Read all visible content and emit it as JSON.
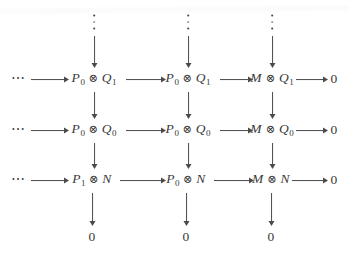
{
  "diagram": {
    "kind": "commutative-diagram",
    "ink_color": "#4a4a4a",
    "background_color": "#ffffff",
    "symbols": {
      "tensor": "⊗",
      "ellipsis_horizontal": "⋯",
      "vdots": "⋮",
      "zero": "0"
    },
    "columns": [
      {
        "id": "col-1",
        "x": 94
      },
      {
        "id": "col-2",
        "x": 188
      },
      {
        "id": "col-3",
        "x": 272
      },
      {
        "id": "col-zero",
        "x": 334
      }
    ],
    "rows": [
      {
        "id": "row-vdots",
        "y": 22
      },
      {
        "id": "row-1",
        "y": 79,
        "label": "Q1 row"
      },
      {
        "id": "row-2",
        "y": 130,
        "label": "Q0 row"
      },
      {
        "id": "row-3",
        "y": 180,
        "label": "N row"
      },
      {
        "id": "row-zero",
        "y": 237,
        "label": "zero row"
      }
    ],
    "top_vdots": [
      {
        "id": "vdots-col-1",
        "glyph": "⋮"
      },
      {
        "id": "vdots-col-2",
        "glyph": "⋮"
      },
      {
        "id": "vdots-col-3",
        "glyph": "⋮"
      }
    ],
    "leading_ellipses": [
      {
        "id": "ldots-row-1",
        "glyph": "⋯"
      },
      {
        "id": "ldots-row-2",
        "glyph": "⋯"
      },
      {
        "id": "ldots-row-3",
        "glyph": "⋯"
      }
    ],
    "nodes": [
      {
        "id": "n-r1-c1",
        "row": "row-1",
        "col": "col-1",
        "text": "P_0 ⊗ Q_1",
        "left": {
          "base": "P",
          "sub": "0"
        },
        "op": "⊗",
        "right": {
          "base": "Q",
          "sub": "1"
        }
      },
      {
        "id": "n-r1-c2",
        "row": "row-1",
        "col": "col-2",
        "text": "P_0 ⊗ Q_1",
        "left": {
          "base": "P",
          "sub": "0"
        },
        "op": "⊗",
        "right": {
          "base": "Q",
          "sub": "1"
        }
      },
      {
        "id": "n-r1-c3",
        "row": "row-1",
        "col": "col-3",
        "text": "M ⊗ Q_1",
        "left": {
          "base": "M",
          "sub": ""
        },
        "op": "⊗",
        "right": {
          "base": "Q",
          "sub": "1"
        }
      },
      {
        "id": "n-r1-c4",
        "row": "row-1",
        "col": "col-zero",
        "text": "0",
        "zero": true
      },
      {
        "id": "n-r2-c1",
        "row": "row-2",
        "col": "col-1",
        "text": "P_0 ⊗ Q_0",
        "left": {
          "base": "P",
          "sub": "0"
        },
        "op": "⊗",
        "right": {
          "base": "Q",
          "sub": "0"
        }
      },
      {
        "id": "n-r2-c2",
        "row": "row-2",
        "col": "col-2",
        "text": "P_0 ⊗ Q_0",
        "left": {
          "base": "P",
          "sub": "0"
        },
        "op": "⊗",
        "right": {
          "base": "Q",
          "sub": "0"
        }
      },
      {
        "id": "n-r2-c3",
        "row": "row-2",
        "col": "col-3",
        "text": "M ⊗ Q_0",
        "left": {
          "base": "M",
          "sub": ""
        },
        "op": "⊗",
        "right": {
          "base": "Q",
          "sub": "0"
        }
      },
      {
        "id": "n-r2-c4",
        "row": "row-2",
        "col": "col-zero",
        "text": "0",
        "zero": true
      },
      {
        "id": "n-r3-c1",
        "row": "row-3",
        "col": "col-1",
        "text": "P_1 ⊗ N",
        "left": {
          "base": "P",
          "sub": "1"
        },
        "op": "⊗",
        "right": {
          "base": "N",
          "sub": ""
        }
      },
      {
        "id": "n-r3-c2",
        "row": "row-3",
        "col": "col-2",
        "text": "P_0 ⊗ N",
        "left": {
          "base": "P",
          "sub": "0"
        },
        "op": "⊗",
        "right": {
          "base": "N",
          "sub": ""
        }
      },
      {
        "id": "n-r3-c3",
        "row": "row-3",
        "col": "col-3",
        "text": "M ⊗ N",
        "left": {
          "base": "M",
          "sub": ""
        },
        "op": "⊗",
        "right": {
          "base": "N",
          "sub": ""
        }
      },
      {
        "id": "n-r3-c4",
        "row": "row-3",
        "col": "col-zero",
        "text": "0",
        "zero": true
      },
      {
        "id": "n-r4-c1",
        "row": "row-zero",
        "col": "col-1",
        "text": "0",
        "zero": true
      },
      {
        "id": "n-r4-c2",
        "row": "row-zero",
        "col": "col-2",
        "text": "0",
        "zero": true
      },
      {
        "id": "n-r4-c3",
        "row": "row-zero",
        "col": "col-3",
        "text": "0",
        "zero": true
      }
    ],
    "glyph_texts": {
      "P": "P",
      "Q": "Q",
      "M": "M",
      "N": "N",
      "zero": "0",
      "sub0": "0",
      "sub1": "1",
      "tensor": "⊗",
      "hdots": "⋯"
    }
  }
}
